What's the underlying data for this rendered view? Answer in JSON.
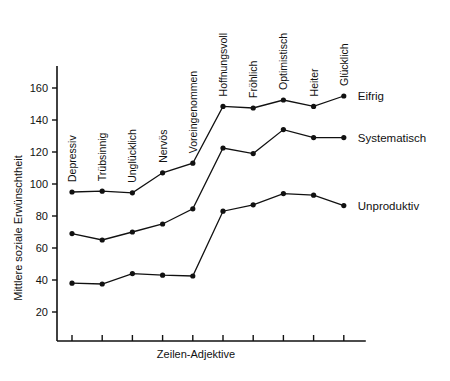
{
  "chart_data": {
    "type": "line",
    "title": "",
    "subtitle": "",
    "xlabel": "Zeilen-Adjektive",
    "ylabel": "Mittlere soziale Erwünschtheit",
    "categories": [
      "Depressiv",
      "Trübsinnig",
      "Unglücklich",
      "Nervös",
      "Voreingenommen",
      "Hoffnungsvoll",
      "Fröhlich",
      "Optimistisch",
      "Heiter",
      "Glücklich"
    ],
    "ylim": [
      0,
      170
    ],
    "yticks": [
      20,
      40,
      60,
      80,
      100,
      120,
      140,
      160
    ],
    "ytick_labels": [
      "20",
      "40",
      "60",
      "80",
      "100",
      "120",
      "140",
      "160"
    ],
    "grid": false,
    "legend_position": "right-inline",
    "series": [
      {
        "name": "Eifrig",
        "values": [
          95,
          95.5,
          94.5,
          107,
          113,
          148.5,
          147.5,
          152.5,
          148.5,
          155
        ]
      },
      {
        "name": "Systematisch",
        "values": [
          69,
          65,
          70,
          75,
          84.5,
          122.5,
          119,
          134,
          129,
          129
        ]
      },
      {
        "name": "Unproduktiv",
        "values": [
          38,
          37.5,
          44,
          43,
          42.5,
          83,
          87,
          94,
          93,
          86.5
        ]
      }
    ]
  },
  "figure": {
    "caption_fragment": ""
  }
}
